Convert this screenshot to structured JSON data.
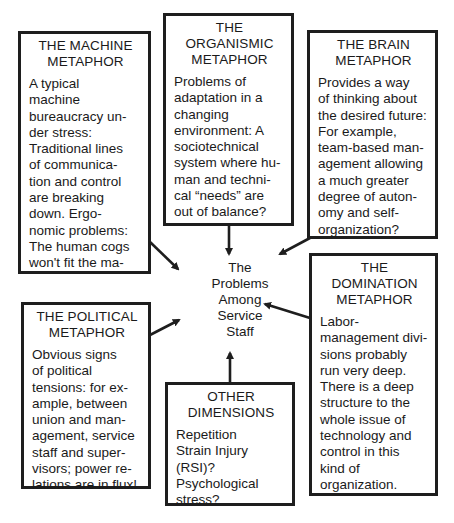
{
  "center": {
    "lines": [
      "The",
      "Problems",
      "Among",
      "Service",
      "Staff"
    ]
  },
  "boxes": {
    "machine": {
      "title": [
        "THE MACHINE",
        "METAPHOR"
      ],
      "body": [
        "A typical",
        "machine",
        "bureaucracy un-",
        "der stress:",
        "Traditional lines",
        "of communica-",
        "tion and control",
        "are breaking",
        "down. Ergo-",
        "nomic problems:",
        "The human cogs",
        "won't fit the ma-"
      ]
    },
    "organismic": {
      "title": [
        "THE",
        "ORGANISMIC",
        "METAPHOR"
      ],
      "body": [
        "Problems of",
        "adaptation in a",
        "changing",
        "environment: A",
        "sociotechnical",
        "system where hu-",
        "man and techni-",
        "cal “needs” are",
        "out of balance?"
      ]
    },
    "brain": {
      "title": [
        "THE BRAIN",
        "METAPHOR"
      ],
      "body": [
        "Provides a way",
        "of thinking about",
        "the desired future:",
        "For example,",
        "team-based man-",
        "agement allowing",
        "a much greater",
        "degree of auton-",
        "omy and self-",
        "organization?"
      ]
    },
    "political": {
      "title": [
        "THE POLITICAL",
        "METAPHOR"
      ],
      "body": [
        "Obvious signs",
        "of political",
        "tensions: for ex-",
        "ample, between",
        "union and man-",
        "agement, service",
        "staff and super-",
        "visors; power re-",
        "lations are in flux!"
      ]
    },
    "other": {
      "title": [
        "OTHER",
        "DIMENSIONS"
      ],
      "body": [
        "Repetition",
        "Strain Injury",
        "(RSI)?",
        "Psychological",
        "stress?"
      ]
    },
    "domination": {
      "title": [
        "THE",
        "DOMINATION",
        "METAPHOR"
      ],
      "body": [
        "Labor-",
        "management divi-",
        "sions probably",
        "run very deep.",
        "There is a deep",
        "structure to the",
        "whole issue of",
        "technology and",
        "control in this",
        "kind of",
        "organization."
      ]
    }
  }
}
